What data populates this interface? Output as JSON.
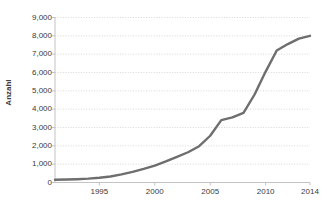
{
  "chart_data": {
    "type": "line",
    "title": "",
    "subtitle": "",
    "xlabel": "",
    "ylabel": "Anzahl",
    "xlim": [
      1991,
      2014
    ],
    "ylim": [
      0,
      9000
    ],
    "grid": true,
    "grid_axis": "y",
    "legend": false,
    "legend_position": "none",
    "x": [
      1991,
      1992,
      1993,
      1994,
      1995,
      1996,
      1997,
      1998,
      1999,
      2000,
      2001,
      2002,
      2003,
      2004,
      2005,
      2006,
      2007,
      2008,
      2009,
      2010,
      2011,
      2012,
      2013,
      2014
    ],
    "series": [
      {
        "name": "Anzahl",
        "color": "#6e6e6e",
        "values": [
          150,
          160,
          180,
          210,
          260,
          330,
          440,
          580,
          740,
          920,
          1150,
          1400,
          1650,
          1980,
          2550,
          3400,
          3550,
          3800,
          4800,
          6050,
          7200,
          7550,
          7850,
          8000
        ]
      }
    ],
    "y_ticks": [
      0,
      1000,
      2000,
      3000,
      4000,
      5000,
      6000,
      7000,
      8000,
      9000
    ],
    "y_tick_labels": [
      "0",
      "1,000",
      "2,000",
      "3,000",
      "4,000",
      "5,000",
      "6,000",
      "7,000",
      "8,000",
      "9,000"
    ],
    "x_ticks": [
      1995,
      2000,
      2005,
      2010,
      2014
    ],
    "x_tick_labels": [
      "1995",
      "2000",
      "2005",
      "2010",
      "2014"
    ]
  },
  "colors": {
    "line": "#6e6e6e",
    "grid": "#cfcfcf",
    "axis": "#c3c3c3",
    "text": "#3a3a3a",
    "background": "#ffffff"
  }
}
